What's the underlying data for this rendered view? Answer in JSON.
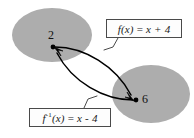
{
  "figure": {
    "type": "function-mapping-diagram",
    "width": 194,
    "height": 138,
    "background_color": "#ffffff"
  },
  "sets": [
    {
      "id": "domain-set",
      "name": "left-oval",
      "fill_color": "#adadad",
      "cx": 52,
      "cy": 35,
      "rx": 40,
      "ry": 27
    },
    {
      "id": "range-set",
      "name": "right-oval",
      "fill_color": "#adadad",
      "cx": 151,
      "cy": 94,
      "rx": 39,
      "ry": 29
    }
  ],
  "nodes": [
    {
      "id": "node-2",
      "label": "2",
      "x": 53,
      "y": 47,
      "dot_color": "#000000"
    },
    {
      "id": "node-6",
      "label": "6",
      "x": 136,
      "y": 100,
      "dot_color": "#000000"
    }
  ],
  "arrows": [
    {
      "id": "forward-arrow",
      "from": "node-2",
      "to": "node-6",
      "direction": "2-to-6",
      "stroke_color": "#000000"
    },
    {
      "id": "inverse-arrow",
      "from": "node-6",
      "to": "node-2",
      "direction": "6-to-2",
      "stroke_color": "#000000"
    }
  ],
  "labels": {
    "forward": {
      "id": "label-fx",
      "function_name": "f",
      "argument": "(x)",
      "equals": "=",
      "expression": "x + 4",
      "full_text": "f(x) = x + 4",
      "border_color": "#4a4a4a",
      "background_color": "#fdfdfd"
    },
    "inverse": {
      "id": "label-finv",
      "function_name": "f",
      "superscript": "-1",
      "argument": "(x)",
      "equals": "=",
      "expression": "x - 4",
      "full_text": "f-1(x) = x - 4",
      "border_color": "#4a4a4a",
      "background_color": "#fdfdfd"
    }
  },
  "colors": {
    "oval_gray": "#adadad",
    "stroke_black": "#000000",
    "box_border": "#4a4a4a",
    "page_white": "#ffffff"
  }
}
